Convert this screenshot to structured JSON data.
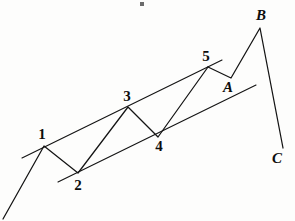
{
  "figure": {
    "background_color": "#fdfdfc",
    "stroke_color": "#141414"
  },
  "chart_data": {
    "type": "line",
    "title": "",
    "subtitle": "",
    "xlabel": "",
    "ylabel": "",
    "xlim": [
      0,
      295
    ],
    "ylim": [
      221,
      0
    ],
    "grid": false,
    "legend": null,
    "annotations": [
      {
        "label": "1",
        "x": 44,
        "y": 146,
        "label_x": 42,
        "label_y": 139,
        "style": "number"
      },
      {
        "label": "2",
        "x": 78,
        "y": 173,
        "label_x": 78,
        "label_y": 190,
        "style": "number"
      },
      {
        "label": "3",
        "x": 128,
        "y": 107,
        "label_x": 127,
        "label_y": 101,
        "style": "number"
      },
      {
        "label": "4",
        "x": 158,
        "y": 137,
        "label_x": 159,
        "label_y": 151,
        "style": "number"
      },
      {
        "label": "5",
        "x": 208,
        "y": 67,
        "label_x": 206,
        "label_y": 61,
        "style": "number"
      },
      {
        "label": "A",
        "x": 231,
        "y": 78,
        "label_x": 228,
        "label_y": 92,
        "style": "letter"
      },
      {
        "label": "B",
        "x": 260,
        "y": 28,
        "label_x": 261,
        "label_y": 20,
        "style": "letter"
      },
      {
        "label": "C",
        "x": 283,
        "y": 148,
        "label_x": 277,
        "label_y": 163,
        "style": "letter"
      }
    ],
    "series": [
      {
        "name": "impulse-wave",
        "type": "line",
        "points": [
          {
            "x": 3,
            "y": 219
          },
          {
            "x": 44,
            "y": 146
          },
          {
            "x": 78,
            "y": 173
          },
          {
            "x": 128,
            "y": 107
          },
          {
            "x": 158,
            "y": 137
          },
          {
            "x": 208,
            "y": 67
          }
        ]
      },
      {
        "name": "corrective-wave",
        "type": "line",
        "points": [
          {
            "x": 208,
            "y": 67
          },
          {
            "x": 231,
            "y": 78
          },
          {
            "x": 260,
            "y": 28
          },
          {
            "x": 283,
            "y": 148
          }
        ]
      },
      {
        "name": "upper-trend-channel",
        "type": "line",
        "points": [
          {
            "x": 22,
            "y": 158
          },
          {
            "x": 222,
            "y": 60
          }
        ]
      },
      {
        "name": "lower-trend-channel",
        "type": "line",
        "points": [
          {
            "x": 58,
            "y": 182
          },
          {
            "x": 256,
            "y": 85
          }
        ]
      }
    ],
    "marks": [
      {
        "name": "ink-speck",
        "x": 140,
        "y": 2,
        "w": 4,
        "h": 4
      }
    ]
  }
}
